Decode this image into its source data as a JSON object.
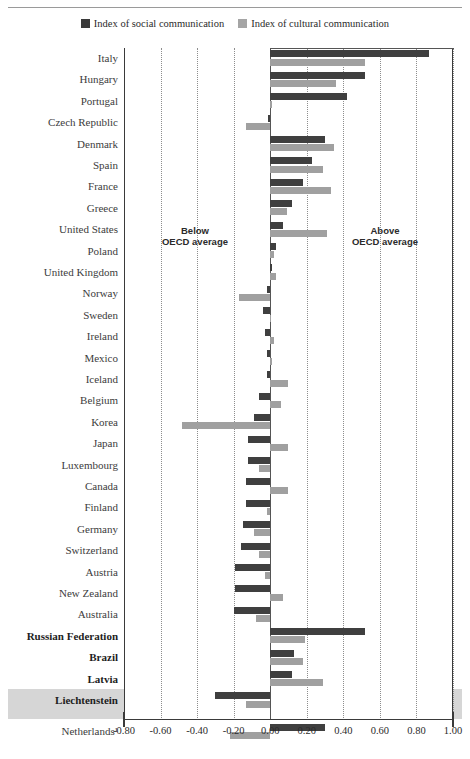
{
  "legend": {
    "items": [
      {
        "label": "Index of social communication",
        "color": "#3f3f3f",
        "name": "social"
      },
      {
        "label": "Index of cultural communication",
        "color": "#a0a0a0",
        "name": "cultural"
      }
    ]
  },
  "annotations": {
    "below": "Below\nOECD average",
    "below_line1": "Below",
    "below_line2": "OECD average",
    "above_line1": "Above",
    "above_line2": "OECD average"
  },
  "axis": {
    "ticks": [
      "-0.80",
      "-0.60",
      "-0.40",
      "-0.20",
      "0.00",
      "0.20",
      "0.40",
      "0.60",
      "0.80",
      "1.00"
    ],
    "min": -0.8,
    "max": 1.0,
    "step": 0.2
  },
  "chart_data": {
    "type": "bar",
    "orientation": "horizontal",
    "title": "",
    "xlabel": "",
    "ylabel": "",
    "xlim": [
      -0.8,
      1.0
    ],
    "grid": true,
    "legend_position": "top-center",
    "categories": [
      "Italy",
      "Hungary",
      "Portugal",
      "Czech Republic",
      "Denmark",
      "Spain",
      "France",
      "Greece",
      "United States",
      "Poland",
      "United Kingdom",
      "Norway",
      "Sweden",
      "Ireland",
      "Mexico",
      "Iceland",
      "Belgium",
      "Korea",
      "Japan",
      "Luxembourg",
      "Canada",
      "Finland",
      "Germany",
      "Switzerland",
      "Austria",
      "New Zealand",
      "Australia",
      "Russian Federation",
      "Brazil",
      "Latvia",
      "Liechtenstein",
      "Netherlands¹"
    ],
    "bold_categories": [
      "Russian Federation",
      "Brazil",
      "Latvia",
      "Liechtenstein"
    ],
    "highlighted_category": "Netherlands¹",
    "series": [
      {
        "name": "Index of social communication",
        "color": "#3f3f3f",
        "values": [
          0.87,
          0.52,
          0.42,
          -0.01,
          0.3,
          0.23,
          0.18,
          0.12,
          0.07,
          0.03,
          0.01,
          -0.02,
          -0.04,
          -0.03,
          -0.02,
          -0.02,
          -0.06,
          -0.09,
          -0.12,
          -0.12,
          -0.13,
          -0.13,
          -0.15,
          -0.16,
          -0.19,
          -0.19,
          -0.2,
          0.52,
          0.13,
          0.12,
          -0.3,
          0.3
        ]
      },
      {
        "name": "Index of cultural communication",
        "color": "#a0a0a0",
        "values": [
          0.52,
          0.36,
          0.01,
          -0.13,
          0.35,
          0.29,
          0.33,
          0.09,
          0.31,
          0.02,
          0.03,
          -0.17,
          0.0,
          0.02,
          0.01,
          0.1,
          0.06,
          -0.48,
          0.1,
          -0.06,
          0.1,
          -0.02,
          -0.09,
          -0.06,
          -0.03,
          0.07,
          -0.08,
          0.19,
          0.18,
          0.29,
          -0.13,
          -0.22
        ]
      }
    ]
  }
}
